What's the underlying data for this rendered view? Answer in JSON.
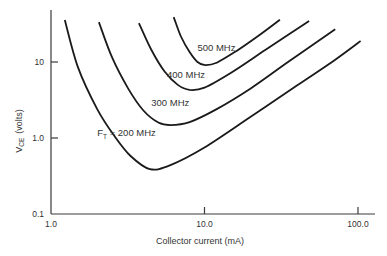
{
  "chart_data": {
    "type": "line",
    "title": "",
    "xlabel": "Collector current (mA)",
    "ylabel": "V_CE (volts)",
    "ylabel_main": "V",
    "ylabel_sub": "CE",
    "ylabel_unit": "(volts)",
    "xscale": "log",
    "yscale": "log",
    "xlim": [
      1.0,
      100.0
    ],
    "ylim": [
      0.1,
      40
    ],
    "x_ticks": [
      {
        "value": 1.0,
        "label": "1.0"
      },
      {
        "value": 10.0,
        "label": "10.0"
      },
      {
        "value": 100.0,
        "label": "100.0"
      }
    ],
    "y_ticks": [
      {
        "value": 0.1,
        "label": "0.1"
      },
      {
        "value": 1.0,
        "label": "1.0"
      },
      {
        "value": 10,
        "label": "10"
      }
    ],
    "grid": false,
    "legend": "inline curve labels",
    "series": [
      {
        "name": "F_T = 200 MHz",
        "label": "200 MHz",
        "label_prefix": "F",
        "label_sub": "T",
        "label_eq": " = ",
        "points": [
          [
            1.23,
            35.7
          ],
          [
            1.5,
            8.5
          ],
          [
            2.0,
            2.4
          ],
          [
            2.6,
            1.05
          ],
          [
            3.3,
            0.58
          ],
          [
            4.4,
            0.39
          ],
          [
            6.0,
            0.44
          ],
          [
            10.0,
            0.75
          ],
          [
            20.0,
            1.9
          ],
          [
            40.0,
            4.9
          ],
          [
            70.0,
            10.5
          ],
          [
            104,
            18.9
          ]
        ]
      },
      {
        "name": "300 MHz",
        "label": "300 MHz",
        "points": [
          [
            2.05,
            33.5
          ],
          [
            2.5,
            11.5
          ],
          [
            3.2,
            4.4
          ],
          [
            4.0,
            2.3
          ],
          [
            5.0,
            1.6
          ],
          [
            6.0,
            1.48
          ],
          [
            8.0,
            1.62
          ],
          [
            12.0,
            2.4
          ],
          [
            20.0,
            4.5
          ],
          [
            35.0,
            10.0
          ],
          [
            71,
            27
          ]
        ]
      },
      {
        "name": "400 MHz",
        "label": "400 MHz",
        "points": [
          [
            3.74,
            32.5
          ],
          [
            4.5,
            14.5
          ],
          [
            5.5,
            7.5
          ],
          [
            6.7,
            5.0
          ],
          [
            8.0,
            4.3
          ],
          [
            10.0,
            4.6
          ],
          [
            15.0,
            7.3
          ],
          [
            25.0,
            14.5
          ],
          [
            48,
            34.5
          ]
        ]
      },
      {
        "name": "500 MHz",
        "label": "500 MHz",
        "points": [
          [
            6.3,
            39
          ],
          [
            7.0,
            22
          ],
          [
            8.0,
            13.5
          ],
          [
            9.0,
            10.0
          ],
          [
            10.1,
            9.1
          ],
          [
            12.0,
            9.8
          ],
          [
            16.0,
            13.8
          ],
          [
            22.0,
            21.5
          ],
          [
            31,
            36
          ]
        ]
      }
    ],
    "label_positions": {
      "200 MHz": [
        2.0,
        1.05
      ],
      "300 MHz": [
        4.5,
        2.6
      ],
      "400 MHz": [
        5.7,
        6.2
      ],
      "500 MHz": [
        9.0,
        14.0
      ]
    }
  }
}
